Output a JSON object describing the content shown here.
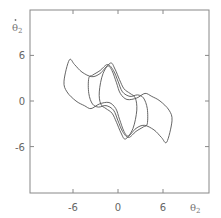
{
  "chart_data": {
    "type": "line",
    "title": "",
    "xlabel": "θ₂",
    "ylabel": "θ̇₂",
    "xlabel_main": "θ",
    "xlabel_sub": "2",
    "ylabel_main": "θ",
    "ylabel_sub": "2",
    "xlim": [
      -11.7,
      12
    ],
    "ylim": [
      -12,
      12
    ],
    "x_ticks": [
      -6,
      0,
      6
    ],
    "x_tick_labels": [
      "-6",
      "0",
      "6"
    ],
    "y_ticks": [
      6,
      0,
      -6
    ],
    "y_tick_labels": [
      "6",
      "0",
      "-6"
    ],
    "grid": false,
    "legend": null,
    "symmetry": "point-symmetric about origin",
    "series": [
      {
        "name": "orbit-outer",
        "points": [
          [
            -6.5,
            5.4
          ],
          [
            -5.8,
            4.8
          ],
          [
            -4.8,
            3.8
          ],
          [
            -3.5,
            3.2
          ],
          [
            -2.4,
            3.6
          ],
          [
            -1.4,
            4.6
          ],
          [
            -0.8,
            4.0
          ],
          [
            -0.2,
            2.4
          ],
          [
            0.3,
            1.0
          ],
          [
            1.2,
            0.2
          ],
          [
            2.5,
            0.4
          ],
          [
            3.6,
            1.0
          ],
          [
            4.5,
            0.6
          ],
          [
            5.6,
            0.0
          ],
          [
            6.8,
            -1.2
          ],
          [
            7.2,
            -2.6
          ],
          [
            6.5,
            -5.4
          ],
          [
            5.8,
            -4.8
          ],
          [
            4.8,
            -3.8
          ],
          [
            3.5,
            -3.2
          ],
          [
            2.4,
            -3.6
          ],
          [
            1.4,
            -4.6
          ],
          [
            0.8,
            -4.0
          ],
          [
            0.2,
            -2.4
          ],
          [
            -0.3,
            -1.0
          ],
          [
            -1.2,
            -0.2
          ],
          [
            -2.5,
            -0.4
          ],
          [
            -3.6,
            -1.0
          ],
          [
            -4.5,
            -0.6
          ],
          [
            -5.6,
            0.0
          ],
          [
            -6.8,
            1.2
          ],
          [
            -7.2,
            2.6
          ]
        ]
      },
      {
        "name": "orbit-middle",
        "points": [
          [
            -3.4,
            3.4
          ],
          [
            -2.4,
            4.0
          ],
          [
            -1.4,
            4.8
          ],
          [
            -0.6,
            4.0
          ],
          [
            0.0,
            2.6
          ],
          [
            0.6,
            1.2
          ],
          [
            1.6,
            0.6
          ],
          [
            2.6,
            0.8
          ],
          [
            3.4,
            0.4
          ],
          [
            3.9,
            -1.0
          ],
          [
            3.9,
            -3.0
          ],
          [
            3.4,
            -3.4
          ],
          [
            2.4,
            -4.0
          ],
          [
            1.4,
            -4.8
          ],
          [
            0.6,
            -4.0
          ],
          [
            0.0,
            -2.6
          ],
          [
            -0.6,
            -1.2
          ],
          [
            -1.6,
            -0.6
          ],
          [
            -2.6,
            -0.8
          ],
          [
            -3.4,
            -0.4
          ],
          [
            -3.9,
            1.0
          ],
          [
            -3.9,
            3.0
          ]
        ]
      },
      {
        "name": "orbit-inner",
        "points": [
          [
            -2.0,
            3.6
          ],
          [
            -1.0,
            5.0
          ],
          [
            -0.4,
            4.2
          ],
          [
            0.2,
            2.8
          ],
          [
            0.8,
            1.6
          ],
          [
            1.6,
            1.0
          ],
          [
            2.3,
            0.4
          ],
          [
            2.5,
            -1.2
          ],
          [
            2.0,
            -3.6
          ],
          [
            1.0,
            -5.0
          ],
          [
            0.4,
            -4.2
          ],
          [
            -0.2,
            -2.8
          ],
          [
            -0.8,
            -1.6
          ],
          [
            -1.6,
            -1.0
          ],
          [
            -2.3,
            -0.4
          ],
          [
            -2.5,
            1.2
          ]
        ]
      }
    ]
  },
  "colors": {
    "axis": "#777777",
    "curve": "#555555",
    "background": "#ffffff"
  }
}
